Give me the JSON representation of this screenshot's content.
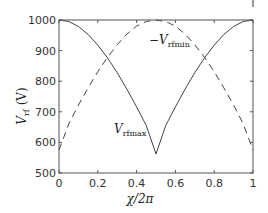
{
  "chart_data": {
    "type": "line",
    "title": "",
    "xlabel": "χ/2π",
    "ylabel": "V_rf (V)",
    "xlim": [
      0,
      1
    ],
    "ylim": [
      500,
      1000
    ],
    "grid": false,
    "x_ticks": [
      "0",
      "0.2",
      "0.4",
      "0.6",
      "0.8",
      "1"
    ],
    "y_ticks": [
      "500",
      "600",
      "700",
      "800",
      "900",
      "1000"
    ],
    "x": [
      0,
      0.05,
      0.1,
      0.15,
      0.2,
      0.25,
      0.3,
      0.35,
      0.4,
      0.45,
      0.5,
      0.55,
      0.6,
      0.65,
      0.7,
      0.75,
      0.8,
      0.85,
      0.9,
      0.95,
      1
    ],
    "series": [
      {
        "name": "V_rfmax",
        "style": "solid",
        "values": [
          1000,
          995,
          979,
          953,
          918,
          876,
          828,
          774,
          716,
          655,
          562,
          655,
          716,
          774,
          828,
          876,
          918,
          953,
          979,
          995,
          1000
        ]
      },
      {
        "name": "-V_rfmin",
        "style": "dashed",
        "values": [
          575,
          660,
          722,
          778,
          831,
          878,
          919,
          954,
          980,
          995,
          1000,
          995,
          980,
          954,
          919,
          878,
          831,
          778,
          722,
          660,
          575
        ]
      }
    ],
    "annotations": [
      {
        "text": "-V_rfmin",
        "x": 0.53,
        "y": 950
      },
      {
        "text": "V_rfmax",
        "x": 0.3,
        "y": 650
      }
    ],
    "legend": "none (inline annotations)"
  },
  "labels": {
    "xlabel_main": "χ/2π",
    "ylabel_main": "V",
    "ylabel_sub": "rf",
    "ylabel_unit": " (V)",
    "ann_min_prefix": "−V",
    "ann_min_sub": "rfmin",
    "ann_max_prefix": "V",
    "ann_max_sub": "rfmax"
  }
}
